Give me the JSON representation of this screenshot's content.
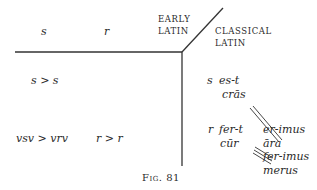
{
  "headers": {
    "col_s": "s",
    "col_r": "r",
    "early_latin": [
      "EARLY",
      "LATIN"
    ],
    "classical_latin": [
      "CLASSICAL",
      "LATIN"
    ]
  },
  "early_rows": [
    {
      "left": "s > s",
      "right": ""
    },
    {
      "left": "vsv > vrv",
      "right": "r > r"
    }
  ],
  "classical": {
    "s_group": {
      "marker": "s",
      "lines": [
        "es-t",
        "crās"
      ]
    },
    "r_group": {
      "marker": "r",
      "lines": [
        "fer-t",
        "cūr"
      ]
    },
    "right_forms": [
      "er-imus",
      "āra",
      "fer-imus",
      "merus"
    ]
  },
  "caption": "Fig. 81"
}
